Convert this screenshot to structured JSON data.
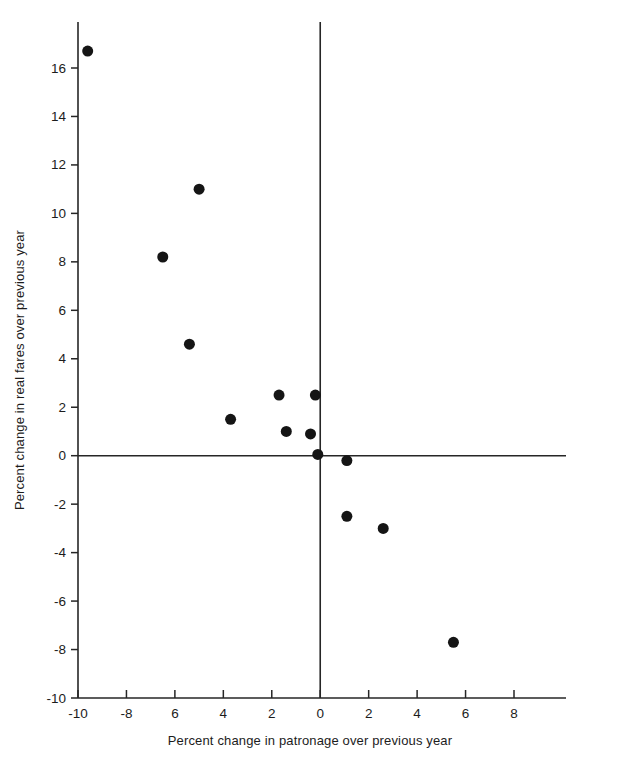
{
  "chart_data": {
    "type": "scatter",
    "title": "",
    "xlabel": "Percent change in patronage over previous year",
    "ylabel": "Percent change in real fares over previous year",
    "xlim": [
      -10,
      9
    ],
    "ylim": [
      -10,
      17.6
    ],
    "grid": false,
    "legend": null,
    "xticks": [
      -10,
      -8,
      -6,
      -4,
      -2,
      0,
      2,
      4,
      6,
      8
    ],
    "xtick_labels": [
      "-10",
      "-8",
      "6",
      "4",
      "2",
      "0",
      "2",
      "4",
      "6",
      "8"
    ],
    "yticks": [
      16,
      14,
      12,
      10,
      8,
      6,
      4,
      2,
      0,
      -2,
      -4,
      -6,
      -8,
      -10
    ],
    "ytick_labels": [
      "16",
      "14",
      "12",
      "10",
      "8",
      "6",
      "4",
      "2",
      "0",
      "-2",
      "-4",
      "-6",
      "-8",
      "-10"
    ],
    "zero_lines": {
      "horizontal": 0,
      "vertical": 0
    },
    "marker": "filled-circle",
    "marker_color": "#151515",
    "marker_size": 11,
    "points": [
      {
        "x": -9.6,
        "y": 16.7
      },
      {
        "x": -5.0,
        "y": 11.0
      },
      {
        "x": -6.5,
        "y": 8.2
      },
      {
        "x": -5.4,
        "y": 4.6
      },
      {
        "x": -1.7,
        "y": 2.5
      },
      {
        "x": -0.2,
        "y": 2.5
      },
      {
        "x": -3.7,
        "y": 1.5
      },
      {
        "x": -1.4,
        "y": 1.0
      },
      {
        "x": -0.4,
        "y": 0.9
      },
      {
        "x": -0.1,
        "y": 0.05
      },
      {
        "x": 1.1,
        "y": -0.2
      },
      {
        "x": 1.1,
        "y": -2.5
      },
      {
        "x": 2.6,
        "y": -3.0
      },
      {
        "x": 5.5,
        "y": -7.7
      }
    ]
  }
}
